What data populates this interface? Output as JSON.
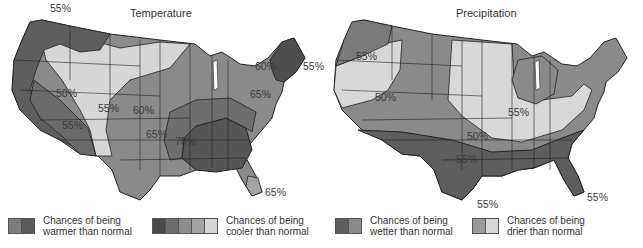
{
  "temperature": {
    "title": "Temperature",
    "labels": [
      {
        "text": "55%",
        "x": 50,
        "y": 8
      },
      {
        "text": "60%",
        "x": 255,
        "y": 64
      },
      {
        "text": "55%",
        "x": 303,
        "y": 64
      },
      {
        "text": "65%",
        "x": 250,
        "y": 92
      },
      {
        "text": "50%",
        "x": 56,
        "y": 91
      },
      {
        "text": "55%",
        "x": 98,
        "y": 104
      },
      {
        "text": "60%",
        "x": 133,
        "y": 108
      },
      {
        "text": "55%",
        "x": 62,
        "y": 123
      },
      {
        "text": "65%",
        "x": 146,
        "y": 130
      },
      {
        "text": "70%",
        "x": 175,
        "y": 137
      },
      {
        "text": "65%",
        "x": 265,
        "y": 188
      }
    ],
    "legend": [
      {
        "text_line1": "Chances of being",
        "text_line2": "warmer than normal",
        "swatches": [
          "#7c7c7c",
          "#5a5a5a"
        ]
      },
      {
        "text_line1": "Chances of being",
        "text_line2": "cooler than normal",
        "swatches": [
          "#4a4a4a",
          "#6e6e6e",
          "#8c8c8c",
          "#a4a4a4",
          "#d6d6d6"
        ]
      }
    ]
  },
  "precipitation": {
    "title": "Precipitation",
    "labels": [
      {
        "text": "55%",
        "x": 34,
        "y": 52
      },
      {
        "text": "50%",
        "x": 53,
        "y": 93
      },
      {
        "text": "55%",
        "x": 186,
        "y": 108
      },
      {
        "text": "50%",
        "x": 145,
        "y": 132
      },
      {
        "text": "55%",
        "x": 134,
        "y": 155
      },
      {
        "text": "55%",
        "x": 155,
        "y": 222
      },
      {
        "text": "55%",
        "x": 268,
        "y": 193
      }
    ],
    "legend": [
      {
        "text_line1": "Chances of being",
        "text_line2": "wetter than normal",
        "swatches": [
          "#5e5e5e",
          "#8a8a8a"
        ]
      },
      {
        "text_line1": "Chances of being",
        "text_line2": "drier than normal",
        "swatches": [
          "#9a9a9a",
          "#d8d8d8"
        ]
      }
    ]
  },
  "colors": {
    "lightest": "#d9d9d9",
    "light": "#a6a6a6",
    "medium": "#8a8a8a",
    "dark": "#6a6a6a",
    "darkest": "#4e4e4e",
    "border": "#222222"
  }
}
